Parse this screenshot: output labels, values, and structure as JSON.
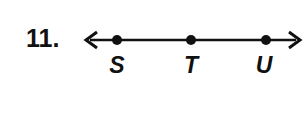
{
  "problem": {
    "number": "11."
  },
  "line": {
    "y": 40,
    "x_start": 85,
    "x_end": 300,
    "arrows": "both",
    "color": "#111111"
  },
  "points": [
    {
      "label": "S",
      "x": 117
    },
    {
      "label": "T",
      "x": 191
    },
    {
      "label": "U",
      "x": 266
    }
  ]
}
